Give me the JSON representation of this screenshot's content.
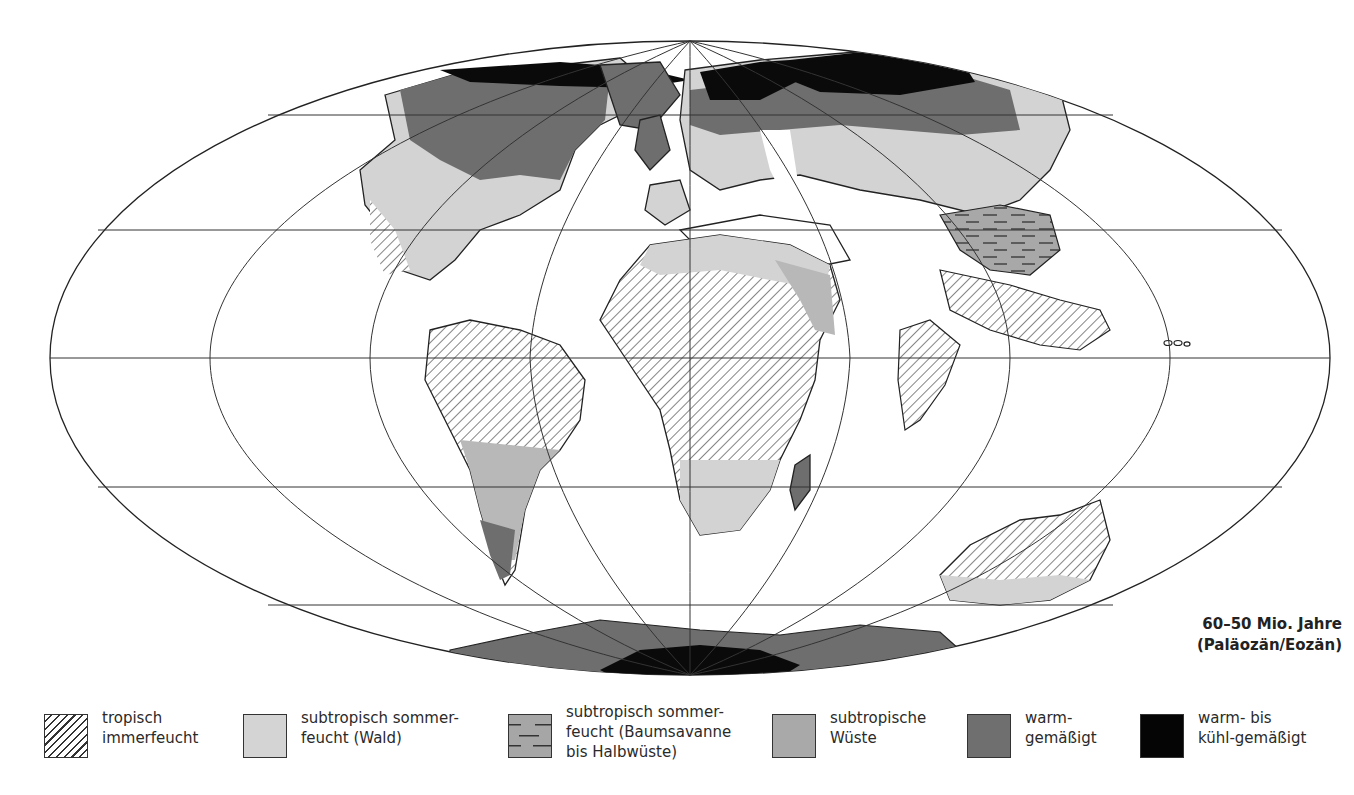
{
  "map": {
    "projection": "mollweide-like ellipse",
    "title_label": {
      "line1": "60–50 Mio. Jahre",
      "line2": "(Paläozän/Eozän)"
    },
    "colors": {
      "ocean": "#ffffff",
      "outline": "#222222",
      "graticule": "#333333",
      "tropisch_immerfeucht": "#ffffff",
      "subtropisch_wald": "#d3d3d3",
      "subtropisch_savanne": "#a8a8a8",
      "subtropische_wueste": "#b8b8b8",
      "warm_gemaessigt": "#6e6e6e",
      "kuehl_gemaessigt": "#0a0a0a"
    }
  },
  "legend": {
    "items": [
      {
        "id": "tropisch-immerfeucht",
        "line1": "tropisch",
        "line2": "immerfeucht",
        "line3": "",
        "pattern": "hatch"
      },
      {
        "id": "subtropisch-wald",
        "line1": "subtropisch sommer-",
        "line2": "feucht (Wald)",
        "line3": "",
        "pattern": "fill",
        "color": "#d4d4d4"
      },
      {
        "id": "subtropisch-savanne",
        "line1": "subtropisch sommer-",
        "line2": "feucht (Baumsavanne",
        "line3": "bis Halbwüste)",
        "pattern": "dash",
        "color": "#a6a6a6"
      },
      {
        "id": "subtropische-wueste",
        "line1": "subtropische",
        "line2": "Wüste",
        "line3": "",
        "pattern": "fill",
        "color": "#a9a9a9"
      },
      {
        "id": "warm-gemaessigt",
        "line1": "warm-",
        "line2": "gemäßigt",
        "line3": "",
        "pattern": "fill",
        "color": "#6f6f6f"
      },
      {
        "id": "warm-bis-kuehl-gemaessigt",
        "line1": "warm- bis",
        "line2": "kühl-gemäßigt",
        "line3": "",
        "pattern": "fill",
        "color": "#050505"
      }
    ]
  }
}
